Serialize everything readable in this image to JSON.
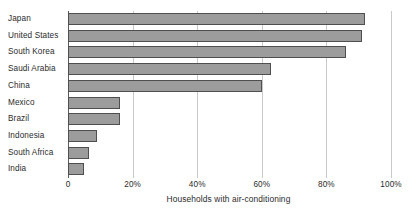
{
  "chart_data": {
    "type": "bar",
    "orientation": "horizontal",
    "title": "",
    "xlabel": "Households with air-conditioning",
    "ylabel": "",
    "xlim": [
      0,
      100
    ],
    "xticks": [
      0,
      20,
      40,
      60,
      80,
      100
    ],
    "xtick_labels": [
      "0",
      "20%",
      "40%",
      "60%",
      "80%",
      "100%"
    ],
    "grid": true,
    "legend": false,
    "categories": [
      "Japan",
      "United States",
      "South Korea",
      "Saudi Arabia",
      "China",
      "Mexico",
      "Brazil",
      "Indonesia",
      "South Africa",
      "India"
    ],
    "values": [
      92,
      91,
      86,
      63,
      60,
      16,
      16,
      9,
      6.5,
      5
    ],
    "bar_fill_color": "#9c9c9c",
    "bar_edge_color": "#4f4f4f",
    "gridline_color": "#c9c9c9",
    "axis_color": "#5a5a5a",
    "background_color": "#ffffff"
  }
}
